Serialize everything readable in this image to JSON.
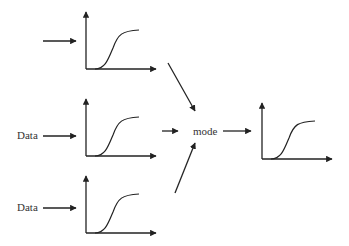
{
  "diagram": {
    "inputs": [
      {
        "label": ""
      },
      {
        "label": "Data"
      },
      {
        "label": "Data"
      }
    ],
    "combiner_label": "mode",
    "colors": {
      "stroke": "#222222",
      "text": "#333333",
      "background": "#ffffff"
    }
  }
}
